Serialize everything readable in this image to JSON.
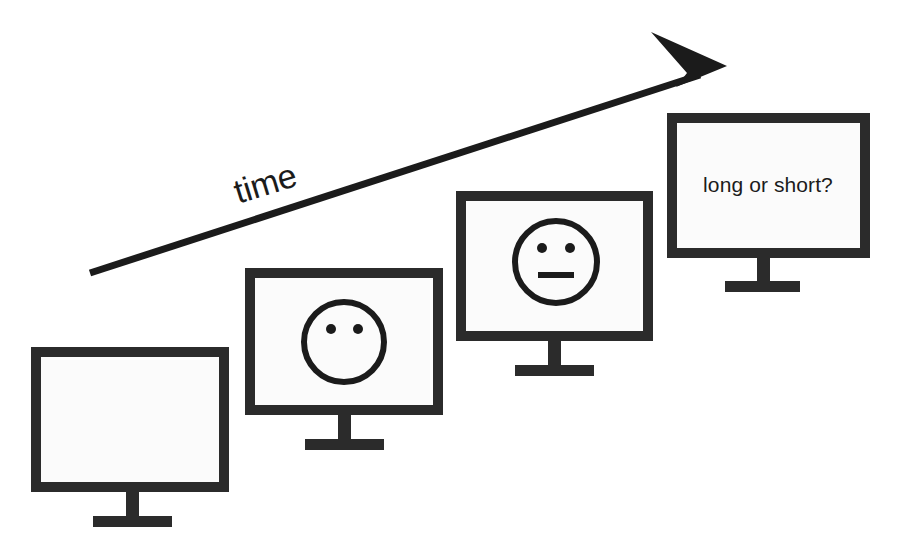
{
  "diagram": {
    "title": "time",
    "background_color": "#ffffff",
    "stroke_color": "#1b1b1b",
    "screen_fill_color": "#fbfbfb",
    "axis": {
      "label": "time",
      "label_rotation_deg": -17,
      "direction": "up-right",
      "arrow_start": {
        "x": 90,
        "y": 273
      },
      "arrow_tip": {
        "x": 727,
        "y": 66
      }
    },
    "monitors": [
      {
        "index": 1,
        "name": "monitor-blank",
        "content_type": "blank",
        "screen_label": "",
        "face": null,
        "frame": {
          "x": 36,
          "y": 352,
          "w": 188,
          "h": 135
        },
        "stand": {
          "neck_x": 126,
          "neck_w": 13,
          "neck_bottom": 527,
          "base_x": 93,
          "base_w": 79,
          "base_h": 11
        }
      },
      {
        "index": 2,
        "name": "monitor-face-eyes-only",
        "content_type": "face",
        "screen_label": "",
        "face": {
          "eyes": true,
          "mouth": false,
          "expression": "no-mouth"
        },
        "frame": {
          "x": 250,
          "y": 273,
          "w": 188,
          "h": 137
        },
        "stand": {
          "neck_x": 338,
          "neck_w": 13,
          "neck_bottom": 450,
          "base_x": 305,
          "base_w": 79,
          "base_h": 11
        }
      },
      {
        "index": 3,
        "name": "monitor-face-neutral",
        "content_type": "face",
        "screen_label": "",
        "face": {
          "eyes": true,
          "mouth": true,
          "expression": "neutral"
        },
        "frame": {
          "x": 461,
          "y": 196,
          "w": 187,
          "h": 140
        },
        "stand": {
          "neck_x": 548,
          "neck_w": 13,
          "neck_bottom": 376,
          "base_x": 515,
          "base_w": 79,
          "base_h": 11
        }
      },
      {
        "index": 4,
        "name": "monitor-question",
        "content_type": "text",
        "screen_label": "long or short?",
        "face": null,
        "frame": {
          "x": 672,
          "y": 118,
          "w": 193,
          "h": 135
        },
        "stand": {
          "neck_x": 757,
          "neck_w": 13,
          "neck_bottom": 290,
          "base_x": 725,
          "base_w": 75,
          "base_h": 11
        }
      }
    ]
  }
}
